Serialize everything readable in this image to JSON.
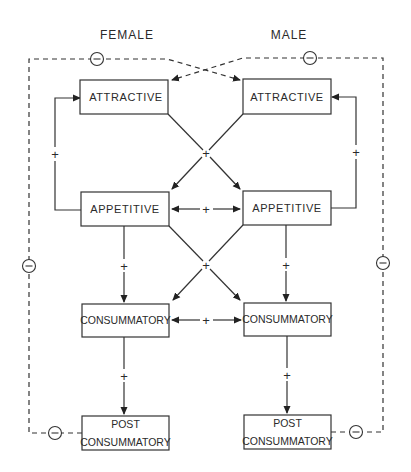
{
  "diagram": {
    "columns": {
      "female": "FEMALE",
      "male": "MALE"
    },
    "female_boxes": {
      "attractive": "ATTRACTIVE",
      "appetitive": "APPETITIVE",
      "consummatory": "CONSUMMATORY",
      "post_line1": "POST",
      "post_line2": "CONSUMMATORY"
    },
    "male_boxes": {
      "attractive": "ATTRACTIVE",
      "appetitive": "APPETITIVE",
      "consummatory": "CONSUMMATORY",
      "post_line1": "POST",
      "post_line2": "CONSUMMATORY"
    },
    "signs": {
      "positive": "+",
      "negative": "−"
    },
    "connections": [
      {
        "from": "female.attractive",
        "to": "male.appetitive",
        "sign": "+",
        "style": "solid"
      },
      {
        "from": "male.attractive",
        "to": "female.appetitive",
        "sign": "+",
        "style": "solid"
      },
      {
        "from": "female.appetitive",
        "to": "female.attractive",
        "sign": "+",
        "style": "solid"
      },
      {
        "from": "male.appetitive",
        "to": "male.attractive",
        "sign": "+",
        "style": "solid"
      },
      {
        "from": "female.appetitive",
        "to": "male.appetitive",
        "sign": "+",
        "style": "solid-bidirectional"
      },
      {
        "from": "female.appetitive",
        "to": "female.consummatory",
        "sign": "+",
        "style": "solid"
      },
      {
        "from": "male.appetitive",
        "to": "male.consummatory",
        "sign": "+",
        "style": "solid"
      },
      {
        "from": "female.appetitive",
        "to": "male.consummatory",
        "sign": "+",
        "style": "solid"
      },
      {
        "from": "male.appetitive",
        "to": "female.consummatory",
        "sign": "+",
        "style": "solid"
      },
      {
        "from": "female.consummatory",
        "to": "male.consummatory",
        "sign": "+",
        "style": "solid-bidirectional"
      },
      {
        "from": "female.consummatory",
        "to": "female.post_consummatory",
        "sign": "+",
        "style": "solid"
      },
      {
        "from": "male.consummatory",
        "to": "male.post_consummatory",
        "sign": "+",
        "style": "solid"
      },
      {
        "from": "female.post_consummatory",
        "to": "male.attractive",
        "sign": "−",
        "style": "dashed"
      },
      {
        "from": "male.post_consummatory",
        "to": "female.attractive",
        "sign": "−",
        "style": "dashed"
      }
    ]
  }
}
